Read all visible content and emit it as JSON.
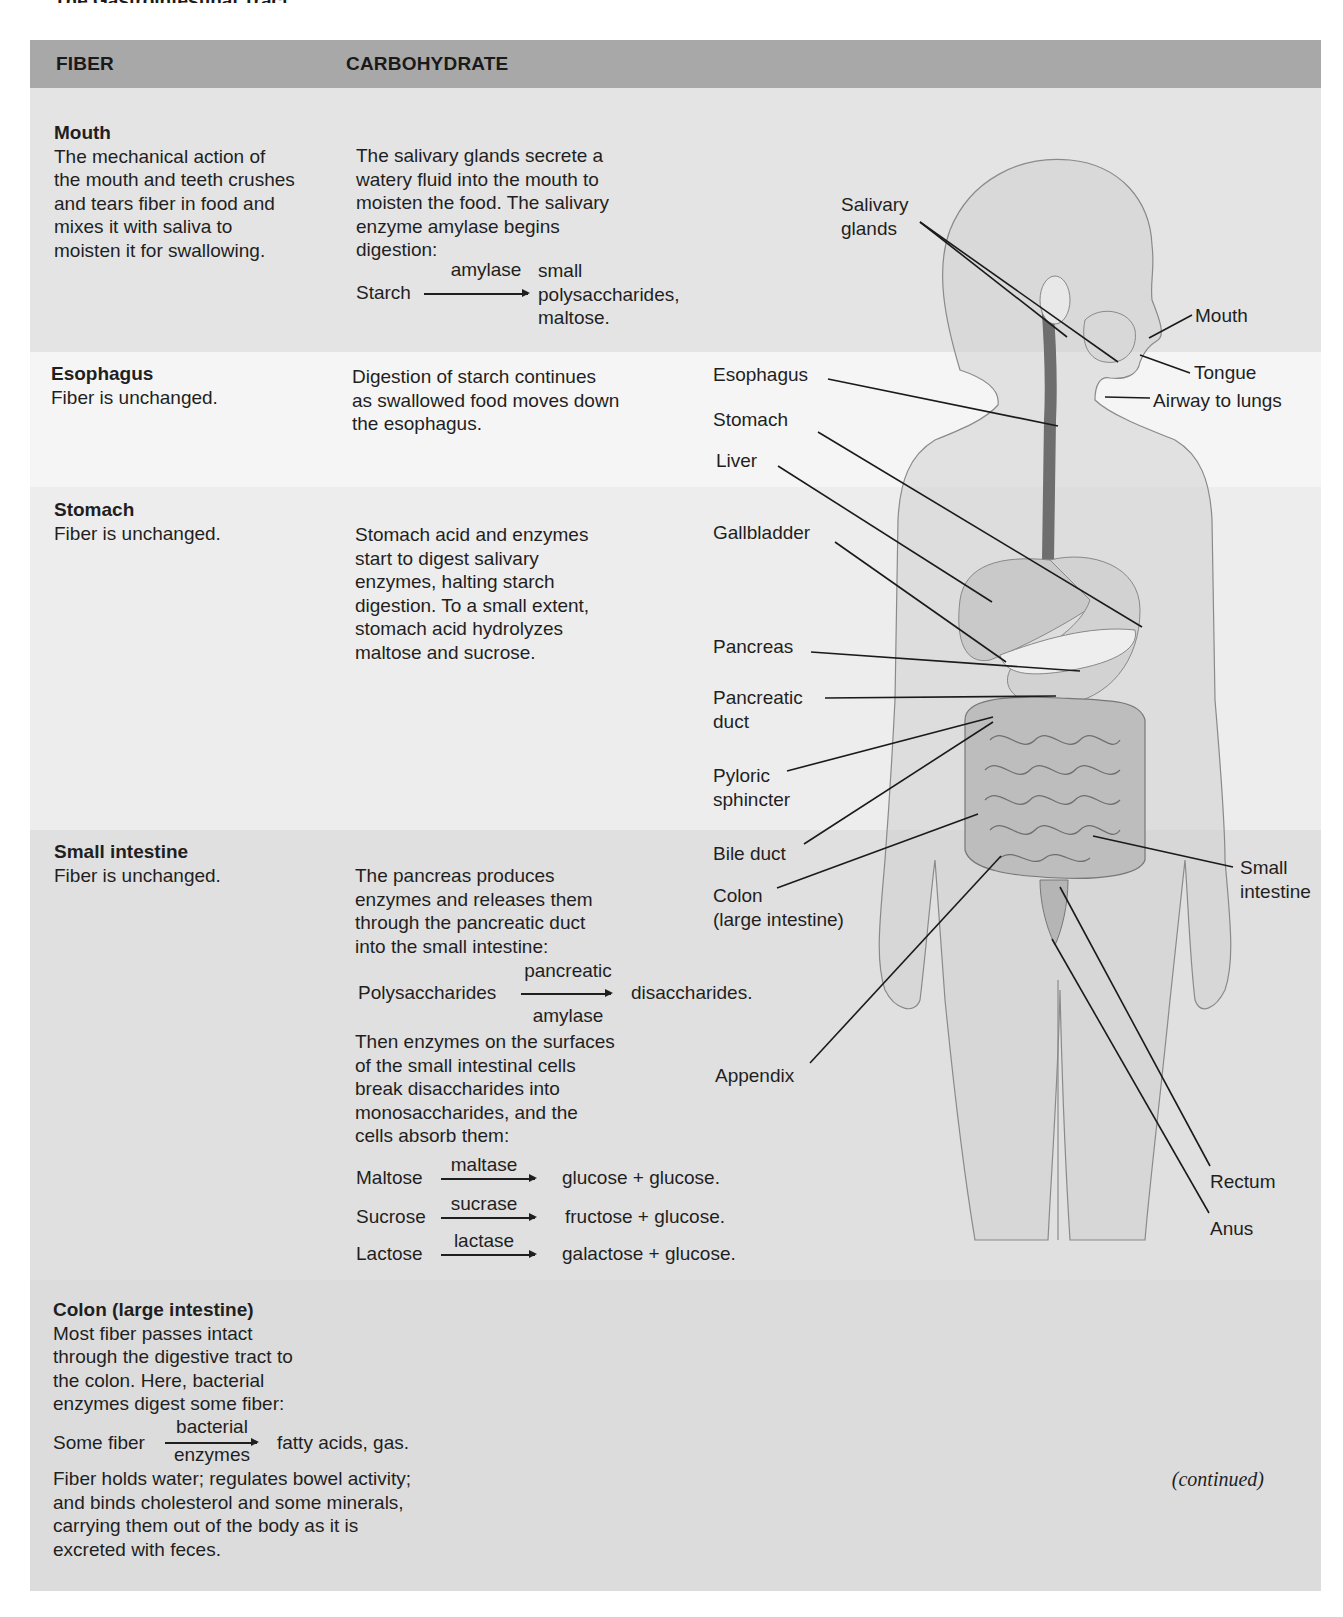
{
  "page": {
    "title": "The Gastrointestinal Tract",
    "continued": "(continued)"
  },
  "table": {
    "columns": [
      "FIBER",
      "CARBOHYDRATE"
    ],
    "header_color": "#a8a8a8",
    "sections": [
      {
        "name": "Mouth",
        "fiber": "The mechanical action of the mouth and teeth crushes and tears fiber in food and mixes it with saliva to moisten it for swallowing.",
        "fiber_lines": [
          "The mechanical action of",
          "the mouth and teeth crushes",
          "and tears fiber in food and",
          "mixes it with saliva to",
          "moisten it for swallowing."
        ],
        "carbohydrate_lines": [
          "The salivary glands secrete a",
          "watery fluid into the mouth to",
          "moisten the food. The salivary",
          "enzyme amylase begins",
          "digestion:"
        ],
        "reactions": [
          {
            "substrate": "Starch",
            "enzyme": "amylase",
            "products": [
              "small",
              "polysaccharides,",
              "maltose."
            ]
          }
        ],
        "band_color": "#e4e4e4"
      },
      {
        "name": "Esophagus",
        "fiber_lines": [
          "Fiber is unchanged."
        ],
        "carbohydrate_lines": [
          "Digestion of starch continues",
          "as swallowed food moves down",
          "the esophagus."
        ],
        "band_color": "#f5f5f5"
      },
      {
        "name": "Stomach",
        "fiber_lines": [
          "Fiber is unchanged."
        ],
        "carbohydrate_lines": [
          "Stomach acid and enzymes",
          "start to digest salivary",
          "enzymes, halting starch",
          "digestion. To a small extent,",
          "stomach acid hydrolyzes",
          "maltose and sucrose."
        ],
        "band_color": "#ededed"
      },
      {
        "name": "Small intestine",
        "fiber_lines": [
          "Fiber is unchanged."
        ],
        "carbohydrate_lines": [
          "The pancreas produces",
          "enzymes and releases them",
          "through the pancreatic duct",
          "into the small intestine:"
        ],
        "reactions": [
          {
            "substrate": "Polysaccharides",
            "enzyme_above": "pancreatic",
            "enzyme_below": "amylase",
            "product": "disaccharides."
          },
          {
            "substrate": "Maltose",
            "enzyme": "maltase",
            "product": "glucose + glucose."
          },
          {
            "substrate": "Sucrose",
            "enzyme": "sucrase",
            "product": "fructose + glucose."
          },
          {
            "substrate": "Lactose",
            "enzyme": "lactase",
            "product": "galactose + glucose."
          }
        ],
        "carbohydrate_lines_2": [
          "Then enzymes on the surfaces",
          "of the small intestinal cells",
          "break disaccharides into",
          "monosaccharides, and the",
          "cells absorb them:"
        ],
        "band_color": "#e0e0e0"
      },
      {
        "name": "Colon (large intestine)",
        "fiber_lines": [
          "Most fiber passes intact",
          "through the digestive tract to",
          "the colon. Here, bacterial",
          "enzymes digest some fiber:"
        ],
        "reactions": [
          {
            "substrate": "Some fiber",
            "enzyme_above": "bacterial",
            "enzyme_below": "enzymes",
            "product": "fatty acids, gas."
          }
        ],
        "fiber_lines_2": [
          "Fiber holds water; regulates bowel activity;",
          "and binds cholesterol and some minerals,",
          "carrying them out of the body as it is",
          "excreted with feces."
        ],
        "band_color": "#dcdcdc"
      }
    ]
  },
  "diagram": {
    "labels": {
      "salivary_glands": [
        "Salivary",
        "glands"
      ],
      "mouth": "Mouth",
      "tongue": "Tongue",
      "airway": "Airway to lungs",
      "esophagus": "Esophagus",
      "stomach": "Stomach",
      "liver": "Liver",
      "gallbladder": "Gallbladder",
      "pancreas": "Pancreas",
      "pancreatic_duct": [
        "Pancreatic",
        "duct"
      ],
      "pyloric_sphincter": [
        "Pyloric",
        "sphincter"
      ],
      "bile_duct": "Bile duct",
      "colon": [
        "Colon",
        "(large intestine)"
      ],
      "small_intestine": [
        "Small",
        "intestine"
      ],
      "appendix": "Appendix",
      "rectum": "Rectum",
      "anus": "Anus"
    }
  }
}
